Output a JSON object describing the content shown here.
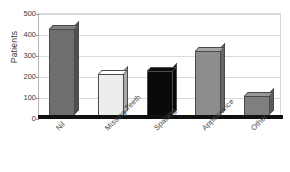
{
  "chart_data": {
    "type": "bar",
    "title": "",
    "xlabel": "",
    "ylabel": "Patients",
    "categories": [
      "Nil",
      "Missing Teeth",
      "Spacing",
      "Appearance",
      "Other"
    ],
    "values": [
      425,
      210,
      222,
      320,
      105
    ],
    "bar_colors": [
      "#6e6e6e",
      "#ededed",
      "#0a0a0a",
      "#8d8d8d",
      "#7f7f7f"
    ],
    "ylim": [
      0,
      500
    ],
    "yticks": [
      0,
      100,
      200,
      300,
      400,
      500
    ],
    "ytick_labels": [
      "0",
      "100",
      "200",
      "300",
      "400",
      "500"
    ],
    "grid": true,
    "legend": false,
    "legend_position": "none",
    "style_3d": true,
    "axis_color": "#b4b4b4",
    "grid_color": "#d9d9d9",
    "baseline_color": "#101010",
    "text_color": "#3b3b3b"
  }
}
